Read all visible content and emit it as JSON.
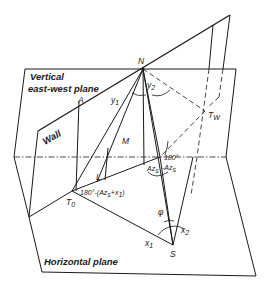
{
  "diagram": {
    "planes": {
      "vertical": "Vertical",
      "vertical_line2": "east-west plane",
      "wall": "Wall",
      "horizontal": "Horizontal plane"
    },
    "points": {
      "N": "N",
      "A": "A",
      "M": "M",
      "L": "L",
      "T0": "T",
      "T0_sub": "0",
      "Tw": "T",
      "Tw_sub": "W",
      "S": "S"
    },
    "angles": {
      "y1": "y",
      "y1_sub": "1",
      "y2": "y",
      "y2_sub": "2",
      "az_s": "Az",
      "az_s_sub": "s",
      "comp1": "180° - Az",
      "comp1_line1": "180°",
      "comp1_line2": "-Az",
      "comp1_sub": "s",
      "t0_angle": "180°-(Az",
      "t0_angle_sub": "s",
      "t0_angle_tail": "+x",
      "t0_angle_tail_sub": "1",
      "t0_angle_close": ")",
      "phi": "φ",
      "x1": "x",
      "x1_sub": "1",
      "x2": "x",
      "x2_sub": "2"
    }
  }
}
